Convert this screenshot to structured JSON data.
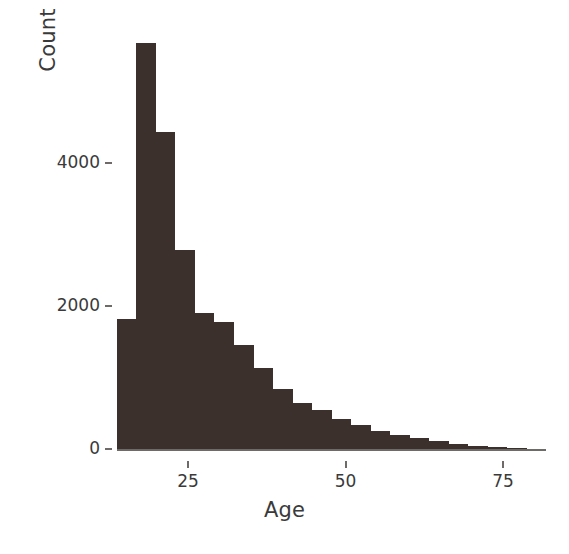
{
  "chart_data": {
    "type": "bar",
    "chart_subtype": "histogram",
    "title": "",
    "xlabel": "Age",
    "ylabel": "Count",
    "xlim": [
      12,
      82
    ],
    "ylim": [
      0,
      5900
    ],
    "grid": false,
    "legend": null,
    "bar_color": "#3b302c",
    "axis_color": "#6e6a68",
    "text_color": "#3a3a3a",
    "background_color": "#ffffff",
    "bin_width": 3.1,
    "x_ticks": [
      {
        "label": "25",
        "value": 25
      },
      {
        "label": "50",
        "value": 50
      },
      {
        "label": "75",
        "value": 75
      }
    ],
    "y_ticks": [
      {
        "label": "0",
        "value": 0
      },
      {
        "label": "2000",
        "value": 2000
      },
      {
        "label": "4000",
        "value": 4000
      }
    ],
    "bins": [
      {
        "x0": 13.7,
        "x1": 16.8,
        "count": 1820
      },
      {
        "x0": 16.8,
        "x1": 19.9,
        "count": 5680
      },
      {
        "x0": 19.9,
        "x1": 23.0,
        "count": 4430
      },
      {
        "x0": 23.0,
        "x1": 26.1,
        "count": 2780
      },
      {
        "x0": 26.1,
        "x1": 29.2,
        "count": 1900
      },
      {
        "x0": 29.2,
        "x1": 32.3,
        "count": 1770
      },
      {
        "x0": 32.3,
        "x1": 35.4,
        "count": 1450
      },
      {
        "x0": 35.4,
        "x1": 38.5,
        "count": 1130
      },
      {
        "x0": 38.5,
        "x1": 41.6,
        "count": 840
      },
      {
        "x0": 41.6,
        "x1": 44.7,
        "count": 640
      },
      {
        "x0": 44.7,
        "x1": 47.8,
        "count": 540
      },
      {
        "x0": 47.8,
        "x1": 50.9,
        "count": 420
      },
      {
        "x0": 50.9,
        "x1": 54.0,
        "count": 330
      },
      {
        "x0": 54.0,
        "x1": 57.1,
        "count": 255
      },
      {
        "x0": 57.1,
        "x1": 60.2,
        "count": 200
      },
      {
        "x0": 60.2,
        "x1": 63.3,
        "count": 150
      },
      {
        "x0": 63.3,
        "x1": 66.4,
        "count": 105
      },
      {
        "x0": 66.4,
        "x1": 69.5,
        "count": 70
      },
      {
        "x0": 69.5,
        "x1": 72.6,
        "count": 42
      },
      {
        "x0": 72.6,
        "x1": 75.7,
        "count": 22
      },
      {
        "x0": 75.7,
        "x1": 78.8,
        "count": 10
      },
      {
        "x0": 78.8,
        "x1": 81.9,
        "count": 4
      }
    ]
  }
}
